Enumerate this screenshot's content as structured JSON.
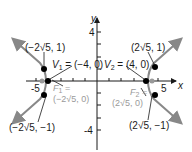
{
  "diagram": {
    "type": "hyperbola",
    "equation": "x^2/16 - y^2/4 = 1",
    "axes": {
      "x_label": "x",
      "y_label": "y",
      "x_ticks_labeled": [
        "-5",
        "5"
      ],
      "y_ticks_labeled": [
        "4",
        "-4"
      ]
    },
    "points": {
      "v1": {
        "name": "V",
        "sub": "1",
        "eq": " = (−4, 0)"
      },
      "v2": {
        "name": "V",
        "sub": "2",
        "eq": " = (4, 0)"
      },
      "f1": {
        "name": "F",
        "sub": "1",
        "eq": " =",
        "coord": "(−2√5, 0)"
      },
      "f2": {
        "name": "F",
        "sub": "2",
        "eq": " =",
        "coord": "(2√5, 0)"
      },
      "p_ul": "(−2√5, 1)",
      "p_ur": "(2√5, 1)",
      "p_ll": "(−2√5, −1)",
      "p_lr": "(2√5, −1)"
    },
    "colors": {
      "curve": "#888888",
      "axes": "#1a1a1a",
      "focus_label": "#9a9a9a",
      "point": "#000000"
    }
  }
}
